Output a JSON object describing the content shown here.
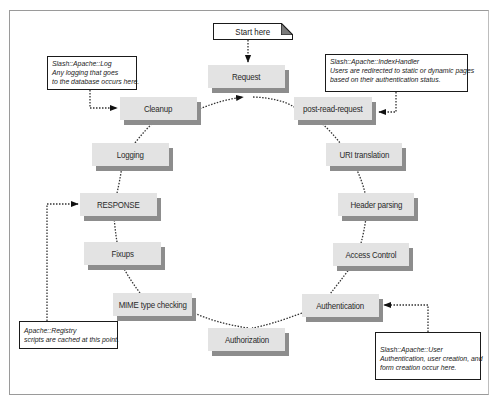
{
  "diagram": {
    "type": "cycle",
    "start_label": "Start here",
    "stages": [
      {
        "id": "request",
        "label": "Request"
      },
      {
        "id": "post-read-request",
        "label": "post-read-request"
      },
      {
        "id": "uri-translation",
        "label": "URI translation"
      },
      {
        "id": "header-parsing",
        "label": "Header parsing"
      },
      {
        "id": "access-control",
        "label": "Access Control"
      },
      {
        "id": "authentication",
        "label": "Authentication"
      },
      {
        "id": "authorization",
        "label": "Authorization"
      },
      {
        "id": "mime-type-checking",
        "label": "MIME type checking"
      },
      {
        "id": "fixups",
        "label": "Fixups"
      },
      {
        "id": "response",
        "label": "RESPONSE"
      },
      {
        "id": "logging",
        "label": "Logging"
      },
      {
        "id": "cleanup",
        "label": "Cleanup"
      }
    ],
    "notes": [
      {
        "id": "log",
        "target": "cleanup",
        "lines": [
          "Slash::Apache::Log",
          "Any logging that goes",
          "to the database occurs here."
        ]
      },
      {
        "id": "indexhandler",
        "target": "post-read-request",
        "lines": [
          "Slash::Apache::IndexHandler",
          "Users are redirected to static or dynamic pages",
          "based on their authentication status."
        ]
      },
      {
        "id": "registry",
        "target": "response",
        "lines": [
          "Apache::Registry",
          "scripts are cached at this point."
        ]
      },
      {
        "id": "user",
        "target": "authentication",
        "lines": [
          "Slash::Apache::User",
          "Authentication, user creation, and",
          "form creation occur here."
        ]
      }
    ]
  }
}
